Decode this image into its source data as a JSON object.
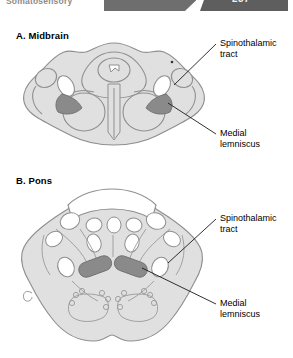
{
  "header": {
    "title": "Somatosensory",
    "page_number": "237"
  },
  "figure": {
    "panels": [
      {
        "id": "midbrain",
        "caption": "A. Midbrain",
        "annotations": [
          {
            "id": "spinothalamic-tract",
            "text": "Spinothalamic\ntract"
          },
          {
            "id": "medial-lemniscus",
            "text": "Medial\nlemniscus"
          }
        ]
      },
      {
        "id": "pons",
        "caption": "B. Pons",
        "annotations": [
          {
            "id": "spinothalamic-tract",
            "text": "Spinothalamic\ntract"
          },
          {
            "id": "medial-lemniscus",
            "text": "Medial\nlemniscus"
          }
        ]
      }
    ]
  },
  "colors": {
    "tissue_fill": "#e0e0e0",
    "tissue_stroke": "#8f8f8f",
    "tract_dark": "#8a8a8a",
    "tract_white": "#ffffff",
    "header_band": "#6e6e6e",
    "page_tab": "#5e5e5e",
    "leader_line": "#1a1a1a"
  }
}
